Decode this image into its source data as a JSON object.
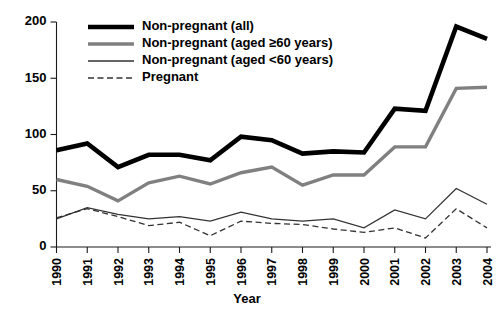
{
  "chart_data": {
    "type": "line",
    "title": "",
    "xlabel": "Year",
    "ylabel": "",
    "grid": false,
    "legend_position": "top-center",
    "x": [
      1990,
      1991,
      1992,
      1993,
      1994,
      1995,
      1996,
      1997,
      1998,
      1999,
      2000,
      2001,
      2002,
      2003,
      2004
    ],
    "categories": [
      "1990",
      "1991",
      "1992",
      "1993",
      "1994",
      "1995",
      "1996",
      "1997",
      "1998",
      "1999",
      "2000",
      "2001",
      "2002",
      "2003",
      "2004"
    ],
    "xlim": [
      1990,
      2004
    ],
    "ylim": [
      0,
      200
    ],
    "yticks": [
      0,
      50,
      100,
      150,
      200
    ],
    "ytick_labels": [
      "0",
      "50",
      "100",
      "150",
      "200"
    ],
    "series": [
      {
        "name": "Non-pregnant (all)",
        "style": "solid",
        "color": "#000000",
        "width": 4.6,
        "values": [
          86,
          92,
          71,
          82,
          82,
          77,
          98,
          95,
          83,
          85,
          84,
          123,
          121,
          196,
          185
        ]
      },
      {
        "name": "Non-pregnant (aged ≥60 years)",
        "style": "solid",
        "color": "#808080",
        "width": 3.4,
        "values": [
          60,
          54,
          41,
          57,
          63,
          56,
          66,
          71,
          55,
          64,
          64,
          89,
          89,
          141,
          142
        ]
      },
      {
        "name": "Non-pregnant (aged <60 years)",
        "style": "solid",
        "color": "#333333",
        "width": 1.3,
        "values": [
          25,
          35,
          29,
          25,
          27,
          23,
          31,
          25,
          23,
          25,
          17,
          33,
          25,
          52,
          38
        ]
      },
      {
        "name": "Pregnant",
        "style": "dashed",
        "color": "#333333",
        "width": 1.3,
        "values": [
          26,
          34,
          27,
          19,
          22,
          10,
          23,
          21,
          20,
          16,
          13,
          17,
          8,
          34,
          17
        ]
      }
    ]
  },
  "legend": {
    "items": [
      {
        "label": "Non-pregnant (all)",
        "swatch": "thick-black-line"
      },
      {
        "label": "Non-pregnant (aged ≥60 years)",
        "swatch": "thick-gray-line"
      },
      {
        "label": "Non-pregnant (aged <60 years)",
        "swatch": "thin-dark-line"
      },
      {
        "label": "Pregnant",
        "swatch": "dashed-line"
      }
    ]
  },
  "colors": {
    "black": "#000000",
    "gray": "#808080",
    "dark_gray": "#333333",
    "background": "#ffffff"
  }
}
